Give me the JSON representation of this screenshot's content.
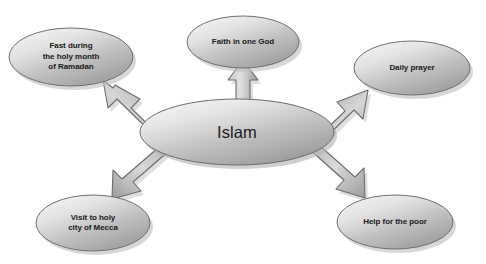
{
  "page": {
    "title": "The Beliefs of Islam",
    "background_color": "#ffffff",
    "width": 486,
    "height": 264
  },
  "diagram": {
    "type": "radial-concept-map",
    "center": {
      "id": "center",
      "label": "Islam",
      "shape": "ellipse",
      "cx": 237,
      "cy": 132,
      "rx": 97,
      "ry": 33,
      "fill_light": "#f0f0f0",
      "fill_dark": "#9a9a9a",
      "stroke": "#6e6e6e"
    },
    "nodes": [
      {
        "id": "fasting",
        "label": "Fast during\nthe holy month\nof Ramadan",
        "shape": "ellipse",
        "cx": 71,
        "cy": 57,
        "rx": 62,
        "ry": 29,
        "fill_light": "#efefef",
        "fill_dark": "#9d9d9d",
        "stroke": "#707070"
      },
      {
        "id": "faith",
        "label": "Faith in one God",
        "shape": "ellipse",
        "cx": 243,
        "cy": 42,
        "rx": 56,
        "ry": 26,
        "fill_light": "#efefef",
        "fill_dark": "#9d9d9d",
        "stroke": "#707070"
      },
      {
        "id": "prayer",
        "label": "Daily prayer",
        "shape": "ellipse",
        "cx": 412,
        "cy": 68,
        "rx": 58,
        "ry": 27,
        "fill_light": "#efefef",
        "fill_dark": "#9d9d9d",
        "stroke": "#707070"
      },
      {
        "id": "mecca",
        "label": "Visit to holy\ncity of Mecca",
        "shape": "ellipse",
        "cx": 93,
        "cy": 223,
        "rx": 57,
        "ry": 28,
        "fill_light": "#efefef",
        "fill_dark": "#9d9d9d",
        "stroke": "#707070"
      },
      {
        "id": "charity",
        "label": "Help for the poor",
        "shape": "ellipse",
        "cx": 395,
        "cy": 222,
        "rx": 58,
        "ry": 27,
        "fill_light": "#efefef",
        "fill_dark": "#9d9d9d",
        "stroke": "#707070"
      }
    ],
    "arrows": [
      {
        "id": "arrow-to-fasting",
        "from": "center",
        "to": "fasting",
        "direction": "up-left",
        "style": "block-arrow-3d"
      },
      {
        "id": "arrow-to-faith",
        "from": "center",
        "to": "faith",
        "direction": "up",
        "style": "block-arrow-3d"
      },
      {
        "id": "arrow-to-prayer",
        "from": "center",
        "to": "prayer",
        "direction": "up-right",
        "style": "block-arrow-3d"
      },
      {
        "id": "arrow-to-mecca",
        "from": "center",
        "to": "mecca",
        "direction": "down-left",
        "style": "block-arrow-3d"
      },
      {
        "id": "arrow-to-charity",
        "from": "center",
        "to": "charity",
        "direction": "down-right",
        "style": "block-arrow-3d"
      }
    ],
    "arrow_fill_light": "#e2e2e2",
    "arrow_fill_dark": "#8f8f8f",
    "arrow_stroke": "#6a6a6a",
    "shadow_color": "#b9b9b9"
  }
}
